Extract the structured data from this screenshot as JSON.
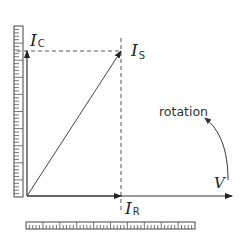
{
  "diagram": {
    "title": "",
    "type": "phasor-diagram",
    "labels": {
      "ic_main": "I",
      "ic_sub": "C",
      "is_main": "I",
      "is_sub": "S",
      "ir_main": "I",
      "ir_sub": "R",
      "v": "V",
      "rotation": "rotation"
    },
    "colors": {
      "stroke": "#333333",
      "dashed": "#555555",
      "ruler": "#444444",
      "background": "#ffffff"
    },
    "vectors": [
      {
        "name": "V",
        "from": [
          27,
          196
        ],
        "to": [
          232,
          196
        ]
      },
      {
        "name": "I_C",
        "from": [
          27,
          196
        ],
        "to": [
          27,
          51
        ]
      },
      {
        "name": "I_S",
        "from": [
          27,
          196
        ],
        "to": [
          121,
          51
        ]
      },
      {
        "name": "I_R",
        "from": [
          27,
          196
        ],
        "to": [
          121,
          196
        ]
      }
    ],
    "rulers": {
      "vertical": {
        "major_divisions": 10,
        "minor_per_major": 5
      },
      "horizontal": {
        "major_divisions": 10,
        "minor_per_major": 5
      }
    }
  }
}
